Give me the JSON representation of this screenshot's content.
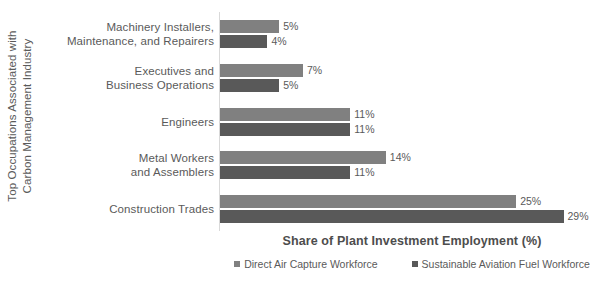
{
  "chart_data": {
    "type": "bar",
    "orientation": "horizontal",
    "title": "",
    "xlabel": "Share of Plant Investment Employment (%)",
    "ylabel": "Top Occupations Associated with Carbon Management Industry",
    "ylabel_lines": [
      "Top Occupations Associated with",
      "Carbon Management Industry"
    ],
    "categories": [
      "Machinery Installers, Maintenance, and Repairers",
      "Executives and Business Operations",
      "Engineers",
      "Metal Workers and Assemblers",
      "Construction Trades"
    ],
    "category_lines": [
      [
        "Machinery Installers,",
        "Maintenance, and Repairers"
      ],
      [
        "Executives and",
        "Business Operations"
      ],
      [
        "Engineers"
      ],
      [
        "Metal Workers",
        "and Assemblers"
      ],
      [
        "Construction Trades"
      ]
    ],
    "series": [
      {
        "name": "Direct Air Capture Workforce",
        "color": "#808080",
        "values": [
          5,
          7,
          11,
          14,
          25
        ],
        "labels": [
          "5%",
          "7%",
          "11%",
          "14%",
          "25%"
        ]
      },
      {
        "name": "Sustainable Aviation Fuel Workforce",
        "color": "#595959",
        "values": [
          4,
          5,
          11,
          11,
          29
        ],
        "labels": [
          "4%",
          "5%",
          "11%",
          "11%",
          "29%"
        ]
      }
    ],
    "xlim": [
      0,
      32.5
    ],
    "grid": false,
    "legend_position": "bottom",
    "axis_color": "#d9d9d9",
    "text_color": "#5a5a5a"
  }
}
